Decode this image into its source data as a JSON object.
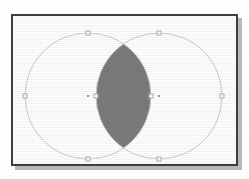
{
  "window": {
    "title": "Shape Selection Canvas",
    "frame_border_color": "#3f3f3f",
    "canvas_background": "#ffffff",
    "shadow_color": "#b9b9b9"
  },
  "canvas": {
    "width": 227,
    "height": 152,
    "origin_x": 11,
    "origin_y": 14
  },
  "shapes": {
    "outline_color": "#cccccc",
    "outline_width": "1",
    "intersection_fill": "#7b7b7b",
    "fill": "none",
    "circle_left": {
      "name": "Circle A",
      "cx": 75,
      "cy": 80,
      "r": 63,
      "selected": "true"
    },
    "circle_right": {
      "name": "Circle B",
      "cx": 146,
      "cy": 80,
      "r": 63,
      "selected": "true"
    },
    "intersection": {
      "name": "Intersection Lens",
      "label": "A ∩ B",
      "fill_color": "#7b7b7b"
    }
  },
  "handles": {
    "handle_fill": "#ffffff",
    "handle_stroke": "#b0b0b0",
    "center_dot_color": "#9a9a9a",
    "size": 4,
    "circle_left_handles": [
      {
        "name": "handle-north",
        "x": 75,
        "y": 17
      },
      {
        "name": "handle-south",
        "x": 75,
        "y": 143
      },
      {
        "name": "handle-west",
        "x": 12,
        "y": 80
      },
      {
        "name": "handle-east",
        "x": 138,
        "y": 80
      }
    ],
    "circle_left_center": {
      "name": "center-dot-a",
      "x": 75,
      "y": 80
    },
    "circle_right_handles": [
      {
        "name": "handle-north",
        "x": 146,
        "y": 17
      },
      {
        "name": "handle-south",
        "x": 146,
        "y": 143
      },
      {
        "name": "handle-west",
        "x": 83,
        "y": 80
      },
      {
        "name": "handle-east",
        "x": 209,
        "y": 80
      }
    ],
    "circle_right_center": {
      "name": "center-dot-b",
      "x": 146,
      "y": 80
    }
  }
}
